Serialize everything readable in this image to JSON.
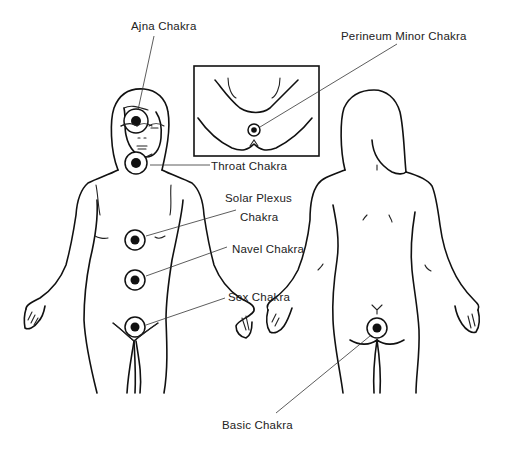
{
  "diagram": {
    "labels": {
      "ajna": "Ajna Chakra",
      "perineum": "Perineum Minor Chakra",
      "throat": "Throat Chakra",
      "solar_plexus_line1": "Solar Plexus",
      "solar_plexus_line2": "Chakra",
      "navel": "Navel Chakra",
      "sex": "Sex Chakra",
      "basic": "Basic Chakra"
    },
    "figures": [
      "front-view-female-figure",
      "back-view-female-figure",
      "perineum-inset"
    ],
    "colors": {
      "line": "#111111",
      "background": "#ffffff",
      "text": "#222222"
    }
  }
}
